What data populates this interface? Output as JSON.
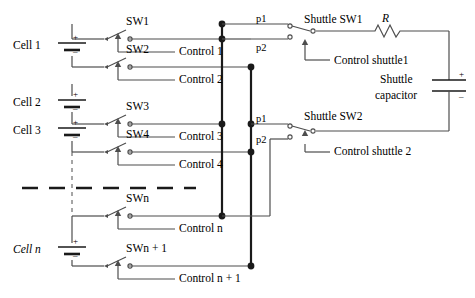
{
  "figure": {
    "kind": "circuit-schematic"
  },
  "cells": [
    {
      "label": "Cell 1",
      "plus": "+",
      "minus": "–"
    },
    {
      "label": "Cell 2",
      "plus": "+",
      "minus": "–"
    },
    {
      "label": "Cell 3",
      "plus": "+",
      "minus": "–"
    },
    {
      "label": "Cell n",
      "plus": "+",
      "minus": "–"
    }
  ],
  "switches": [
    {
      "name": "SW1",
      "control": "Control 1"
    },
    {
      "name": "SW2",
      "control": "Control 2"
    },
    {
      "name": "SW3",
      "control": "Control 3"
    },
    {
      "name": "SW4",
      "control": "Control 4"
    },
    {
      "name": "SWn",
      "control": "Control n"
    },
    {
      "name": "SWn + 1",
      "control": "Control n + 1"
    }
  ],
  "shuttle_switches": [
    {
      "name": "Shuttle SW1",
      "control": "Control shuttle1",
      "p1": "p1",
      "p2": "p2"
    },
    {
      "name": "Shuttle SW2",
      "control": "Control shuttle 2",
      "p1": "p1",
      "p2": "p2"
    }
  ],
  "resistor": {
    "label": "R"
  },
  "capacitor": {
    "line1": "Shuttle",
    "line2": "capacitor",
    "plus": "+",
    "minus": "–"
  },
  "ellipsis": {
    "style": "dashed-horizontal-rule"
  },
  "colors": {
    "wire": "#4d4d4d",
    "bus": "#1a1a1a",
    "text": "#000000",
    "background": "#ffffff"
  }
}
